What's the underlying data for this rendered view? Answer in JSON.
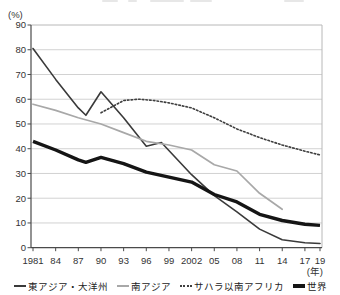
{
  "chart_data": {
    "type": "line",
    "title": "",
    "ylabel": "(%)",
    "xlabel": "(年)",
    "ylim": [
      0,
      90
    ],
    "grid": true,
    "legend_position": "bottom",
    "y_ticks": [
      90,
      80,
      70,
      60,
      50,
      40,
      30,
      20,
      10,
      0
    ],
    "x_ticks": [
      {
        "year": 1981,
        "label": "1981"
      },
      {
        "year": 1984,
        "label": "84"
      },
      {
        "year": 1987,
        "label": "87"
      },
      {
        "year": 1990,
        "label": "90"
      },
      {
        "year": 1993,
        "label": "93"
      },
      {
        "year": 1996,
        "label": "96"
      },
      {
        "year": 1999,
        "label": "99"
      },
      {
        "year": 2002,
        "label": "2002"
      },
      {
        "year": 2005,
        "label": "05"
      },
      {
        "year": 2008,
        "label": "08"
      },
      {
        "year": 2011,
        "label": "11"
      },
      {
        "year": 2014,
        "label": "14"
      },
      {
        "year": 2017,
        "label": "17"
      },
      {
        "year": 2019,
        "label": "19"
      }
    ],
    "series": [
      {
        "name": "東アジア・大洋州",
        "style": "thin-dark",
        "color": "#3a3a3a",
        "points": [
          [
            1981,
            80.5
          ],
          [
            1984,
            68
          ],
          [
            1987,
            56.5
          ],
          [
            1988,
            53.5
          ],
          [
            1990,
            63
          ],
          [
            1993,
            52.5
          ],
          [
            1996,
            41
          ],
          [
            1998,
            42.5
          ],
          [
            2002,
            29.5
          ],
          [
            2005,
            21
          ],
          [
            2008,
            14.5
          ],
          [
            2011,
            7.5
          ],
          [
            2014,
            3.2
          ],
          [
            2017,
            2
          ],
          [
            2019,
            1.7
          ]
        ]
      },
      {
        "name": "南アジア",
        "style": "thin-gray",
        "color": "#a8a8a8",
        "points": [
          [
            1981,
            58
          ],
          [
            1984,
            55.5
          ],
          [
            1987,
            52.5
          ],
          [
            1990,
            50
          ],
          [
            1993,
            46.5
          ],
          [
            1996,
            43
          ],
          [
            1999,
            41.5
          ],
          [
            2002,
            39.5
          ],
          [
            2005,
            33.5
          ],
          [
            2008,
            31
          ],
          [
            2011,
            22
          ],
          [
            2014,
            15.5
          ]
        ]
      },
      {
        "name": "サハラ以南アフリカ",
        "style": "dotted",
        "color": "#3f3f3f",
        "points": [
          [
            1990,
            54.5
          ],
          [
            1993,
            59.5
          ],
          [
            1995,
            60
          ],
          [
            1997,
            59.5
          ],
          [
            1999,
            58.5
          ],
          [
            2002,
            56.5
          ],
          [
            2005,
            52.5
          ],
          [
            2008,
            48
          ],
          [
            2011,
            44.5
          ],
          [
            2014,
            41.5
          ],
          [
            2017,
            39
          ],
          [
            2019,
            37.5
          ]
        ]
      },
      {
        "name": "世界",
        "style": "thick",
        "color": "#151515",
        "points": [
          [
            1981,
            43
          ],
          [
            1984,
            39.5
          ],
          [
            1987,
            35.5
          ],
          [
            1988,
            34.5
          ],
          [
            1990,
            36.5
          ],
          [
            1993,
            34
          ],
          [
            1996,
            30.5
          ],
          [
            1999,
            28.5
          ],
          [
            2002,
            26.5
          ],
          [
            2005,
            21.5
          ],
          [
            2008,
            18.5
          ],
          [
            2011,
            13.5
          ],
          [
            2014,
            11
          ],
          [
            2017,
            9.5
          ],
          [
            2019,
            9
          ]
        ]
      }
    ]
  }
}
